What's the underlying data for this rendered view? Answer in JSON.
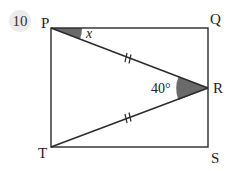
{
  "question": {
    "number": "10"
  },
  "points": {
    "P": {
      "label": "P",
      "x": 51,
      "y": 28
    },
    "Q": {
      "label": "Q",
      "x": 208,
      "y": 28
    },
    "R": {
      "label": "R",
      "x": 208,
      "y": 88
    },
    "S": {
      "label": "S",
      "x": 208,
      "y": 147
    },
    "T": {
      "label": "T",
      "x": 51,
      "y": 147
    }
  },
  "angles": {
    "at_P": {
      "label": "x",
      "shaded": true
    },
    "at_R": {
      "label": "40°",
      "shaded": true
    }
  },
  "equal_marks": {
    "PR": "//",
    "TR": "//"
  },
  "colors": {
    "line": "#2a2a2a",
    "shade": "#6a6a6a",
    "badge": "#ebebeb"
  }
}
